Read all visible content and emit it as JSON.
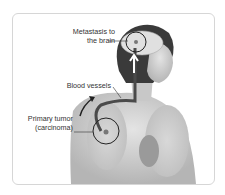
{
  "labels": {
    "metastasis_line1": "Metastasis to",
    "metastasis_line2": "the brain",
    "blood_vessels": "Blood vessels",
    "primary_tumor_line1": "Primary tumor",
    "primary_tumor_line2": "(carcinoma)"
  },
  "colors": {
    "frame_border": "#d6d6d6",
    "illustration_gray": "#9a9a9a",
    "hair": "#3a3a3a",
    "vessel": "#4a4a4a",
    "arrow": "#222222"
  }
}
